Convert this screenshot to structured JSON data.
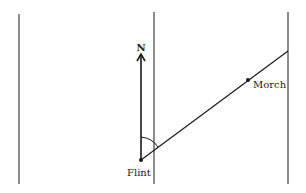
{
  "diagram": {
    "north_label": "N",
    "places": [
      {
        "name": "Flint",
        "x": 141,
        "y": 160
      },
      {
        "name": "Morch",
        "x": 248,
        "y": 80
      }
    ],
    "colors": {
      "ink": "#1a1a1a",
      "background": "#ffffff"
    }
  }
}
